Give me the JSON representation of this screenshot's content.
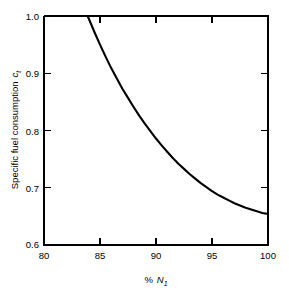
{
  "figure": {
    "background_color": "#ffffff",
    "line_color": "#000000"
  },
  "chart_data": {
    "type": "line",
    "title": "",
    "subtitle": "",
    "xlabel_parts": {
      "percent": "%",
      "symbol": "N",
      "subscript": "1"
    },
    "xlabel": "% N1",
    "ylabel_parts": {
      "text": "Specific fuel consumption",
      "symbol": "c",
      "subscript": "t"
    },
    "ylabel": "Specific fuel consumption ct",
    "xlim": [
      80,
      100
    ],
    "ylim": [
      0.6,
      1.0
    ],
    "xticks": [
      80,
      85,
      90,
      95,
      100
    ],
    "xtick_labels": [
      "80",
      "85",
      "90",
      "95",
      "100"
    ],
    "yticks": [
      0.6,
      0.7,
      0.8,
      0.9,
      1.0
    ],
    "ytick_labels": [
      "0.6",
      "0.7",
      "0.8",
      "0.9",
      "1.0"
    ],
    "grid": false,
    "legend": false,
    "legend_position": "none",
    "tick_direction": "in",
    "series": [
      {
        "name": "Specific fuel consumption",
        "color": "#000000",
        "x": [
          83.9,
          84.5,
          85.0,
          85.5,
          86.0,
          86.5,
          87.0,
          87.5,
          88.0,
          88.5,
          89.0,
          89.5,
          90.0,
          90.5,
          91.0,
          91.5,
          92.0,
          92.5,
          93.0,
          93.5,
          94.0,
          94.5,
          95.0,
          95.5,
          96.0,
          96.5,
          97.0,
          97.5,
          98.0,
          98.5,
          99.0,
          99.5,
          100.0
        ],
        "y": [
          1.0,
          0.972,
          0.95,
          0.929,
          0.909,
          0.891,
          0.873,
          0.857,
          0.841,
          0.826,
          0.812,
          0.799,
          0.786,
          0.774,
          0.763,
          0.752,
          0.742,
          0.733,
          0.724,
          0.716,
          0.708,
          0.701,
          0.694,
          0.688,
          0.683,
          0.678,
          0.673,
          0.669,
          0.665,
          0.662,
          0.659,
          0.656,
          0.654
        ]
      }
    ],
    "annotations": []
  }
}
